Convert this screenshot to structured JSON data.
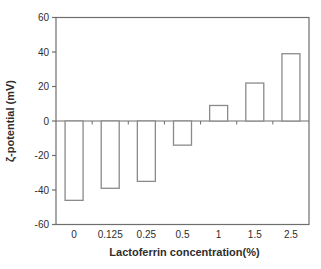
{
  "figure": {
    "background": "#ffffff"
  },
  "colors": {
    "axis": "#6e6e6e",
    "bar_outline": "#8a8a8a",
    "bar_fill": "#ffffff",
    "text": "#2e2e2e"
  },
  "chart_data": {
    "type": "bar",
    "title": "",
    "xlabel": "Lactoferrin concentration(%)",
    "ylabel": "ζ-potential (mV)",
    "categories": [
      "0",
      "0.125",
      "0.25",
      "0.5",
      "1",
      "1.5",
      "2.5"
    ],
    "values": [
      -46,
      -39,
      -35,
      -14,
      9,
      22,
      39
    ],
    "ylim": [
      -60,
      60
    ],
    "yticks": [
      60,
      40,
      20,
      0,
      -20,
      -40,
      -60
    ],
    "grid": "off",
    "legend": "none",
    "axis_cross_at": 0
  }
}
